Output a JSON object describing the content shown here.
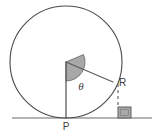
{
  "figure": {
    "kind": "geometry-diagram",
    "width": 161,
    "height": 136,
    "background_color": "#ffffff"
  },
  "colors": {
    "stroke": "#4a4a4a",
    "stroke_light": "#5a5a5a",
    "wedge_fill": "#a8a8a8",
    "wedge_stroke": "#6e6e6e",
    "block_fill": "#a8a8a8",
    "block_stroke": "#5e5e5e",
    "ground_line": "#6a6a6a",
    "label_color": "#3c3c3c",
    "dash_color": "#6a6a6a"
  },
  "circle": {
    "center_x": 66,
    "center_y": 62,
    "radius": 56,
    "stroke_width": 1.1
  },
  "ground": {
    "y": 118,
    "x_start": 12,
    "x_end": 152,
    "stroke_width": 1.2
  },
  "points": {
    "center": {
      "x": 66,
      "y": 62,
      "label": ""
    },
    "P": {
      "x": 66,
      "y": 118,
      "label": "P",
      "label_x": 66,
      "label_y": 130
    },
    "R": {
      "x": 113,
      "y": 82,
      "label": "R",
      "label_x": 119,
      "label_y": 86
    }
  },
  "angle": {
    "symbol": "θ",
    "label_x": 81,
    "label_y": 90,
    "wedge_radius": 19,
    "start_deg": 90,
    "sweep_deg": 113,
    "vertex_x": 66,
    "vertex_y": 62
  },
  "segments": {
    "center_to_p": {
      "x1": 66,
      "y1": 62,
      "x2": 66,
      "y2": 118,
      "style": "solid"
    },
    "center_to_r": {
      "x1": 66,
      "y1": 62,
      "x2": 113,
      "y2": 82,
      "style": "solid"
    },
    "r_to_ground": {
      "x1": 118,
      "y1": 84,
      "x2": 118,
      "y2": 107,
      "style": "dashed",
      "dash": "3 3"
    }
  },
  "block": {
    "x": 118,
    "y": 107,
    "width": 13,
    "height": 11,
    "inner_inset": 2.5
  },
  "labels": {
    "point_p": "P",
    "point_r": "R",
    "angle_theta": "θ"
  }
}
